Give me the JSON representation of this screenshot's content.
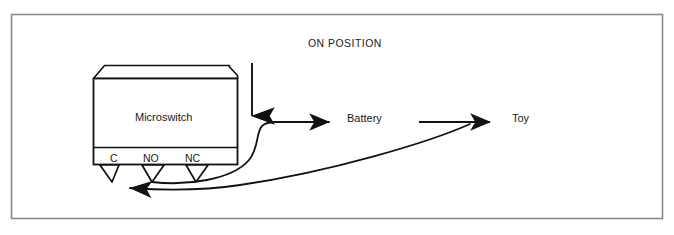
{
  "figure": {
    "title": "ON POSITION",
    "border_color": "#8a8a8a",
    "line_color": "#111111",
    "background": "#ffffff"
  },
  "switch": {
    "body_label": "Microswitch",
    "terminals": [
      {
        "id": "c",
        "label": "C"
      },
      {
        "id": "no",
        "label": "NO"
      },
      {
        "id": "nc",
        "label": "NC"
      }
    ]
  },
  "components": [
    {
      "id": "battery",
      "label": "Battery"
    },
    {
      "id": "toy",
      "label": "Toy"
    }
  ],
  "icons": {
    "actuator": "down-arrow-icon",
    "flow_to_battery": "right-arrow-icon",
    "flow_to_toy": "right-arrow-icon",
    "return_to_common": "left-arrow-icon"
  }
}
